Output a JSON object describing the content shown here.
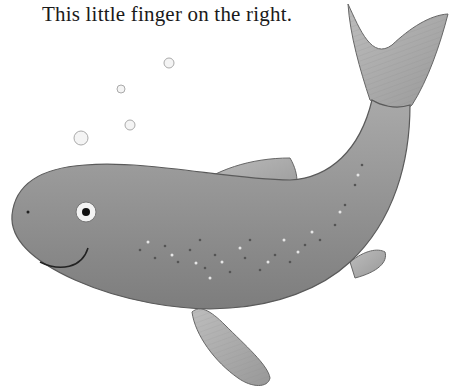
{
  "page": {
    "caption": "This little finger on the right.",
    "illustration": {
      "subject": "fish",
      "bubbles_count": 4,
      "colors": {
        "body": "#8e8e8e",
        "body_light": "#b4b4b4",
        "fin": "#a8a8a8",
        "outline": "#555555",
        "background": "#ffffff"
      }
    }
  }
}
